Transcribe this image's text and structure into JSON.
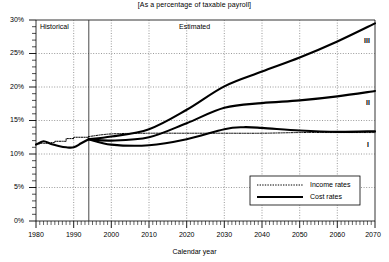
{
  "chart_data": {
    "type": "line",
    "title": "[As a percentage of taxable payroll]",
    "xlabel": "Calendar year",
    "ylabel": "",
    "xlim": [
      1980,
      2070
    ],
    "ylim": [
      0,
      30
    ],
    "grid": true,
    "x_ticks": [
      1980,
      1990,
      2000,
      2010,
      2020,
      2030,
      2040,
      2050,
      2060,
      2070
    ],
    "x_tick_labels": [
      "1980",
      "1990",
      "2000",
      "2010",
      "2020",
      "2030",
      "2040",
      "2050",
      "2060",
      "2070"
    ],
    "y_ticks": [
      0,
      5,
      10,
      15,
      20,
      25,
      30
    ],
    "y_tick_labels": [
      "0%",
      "5%",
      "10%",
      "15%",
      "20%",
      "25%",
      "30%"
    ],
    "y_minor_tick_step": 1,
    "legend_position": "lower-right",
    "legend": [
      {
        "name": "Income rates",
        "style": "dotted-thin"
      },
      {
        "name": "Cost rates",
        "style": "solid-thick"
      }
    ],
    "annotations": [
      {
        "text": "Historical",
        "x": 1983.5,
        "y": 28.1
      },
      {
        "text": "Estimated",
        "x": 2019.0,
        "y": 28.1
      },
      {
        "text": "III",
        "x": 2067.0,
        "y": 25.9
      },
      {
        "text": "II",
        "x": 2067.0,
        "y": 17.5
      },
      {
        "text": "I",
        "x": 2067.0,
        "y": 11.6
      }
    ],
    "divider_year": 1994,
    "series": [
      {
        "name": "Income rates (historical)",
        "style": "dotted-thin",
        "x": [
          1980,
          1981,
          1982,
          1983,
          1984,
          1985,
          1986,
          1987,
          1988,
          1989,
          1990,
          1991,
          1992,
          1993,
          1994
        ],
        "values": [
          11.5,
          11.6,
          11.6,
          11.6,
          11.7,
          11.9,
          11.9,
          11.9,
          12.3,
          12.3,
          12.5,
          12.5,
          12.5,
          12.5,
          12.6
        ]
      },
      {
        "name": "Income rates (estimated)",
        "style": "dotted-thin",
        "x": [
          1994,
          2000,
          2010,
          2020,
          2030,
          2040,
          2050,
          2060,
          2070
        ],
        "values": [
          12.6,
          13.0,
          13.1,
          13.1,
          13.1,
          13.1,
          13.2,
          13.2,
          13.2
        ]
      },
      {
        "name": "Cost rates (historical)",
        "style": "solid-thick",
        "x": [
          1980,
          1982,
          1984,
          1986,
          1988,
          1990,
          1992,
          1994
        ],
        "values": [
          11.4,
          11.9,
          11.5,
          11.2,
          11.0,
          11.0,
          11.6,
          12.2
        ]
      },
      {
        "name": "Cost rates alternative I (low cost)",
        "style": "solid-thick",
        "x": [
          1994,
          2000,
          2010,
          2020,
          2030,
          2035,
          2040,
          2050,
          2060,
          2070
        ],
        "values": [
          12.2,
          11.4,
          11.3,
          12.2,
          13.7,
          14.0,
          13.9,
          13.5,
          13.3,
          13.4
        ]
      },
      {
        "name": "Cost rates alternative II (intermediate)",
        "style": "solid-thick",
        "x": [
          1994,
          2000,
          2010,
          2020,
          2030,
          2040,
          2050,
          2060,
          2070
        ],
        "values": [
          12.2,
          12.0,
          12.5,
          14.6,
          16.9,
          17.6,
          18.0,
          18.6,
          19.4
        ]
      },
      {
        "name": "Cost rates alternative III (high cost)",
        "style": "solid-thick",
        "x": [
          1994,
          2000,
          2010,
          2020,
          2030,
          2040,
          2050,
          2060,
          2070
        ],
        "values": [
          12.2,
          12.6,
          13.7,
          16.6,
          20.1,
          22.3,
          24.4,
          26.8,
          29.5
        ]
      }
    ]
  },
  "labels": {
    "historical": "Historical",
    "estimated": "Estimated",
    "curve_i": "I",
    "curve_ii": "II",
    "curve_iii": "III",
    "legend_income": "Income rates",
    "legend_cost": "Cost rates",
    "axis_x_title": "Calendar year",
    "title": "[As a percentage of taxable payroll]",
    "y0": "0%",
    "y5": "5%",
    "y10": "10%",
    "y15": "15%",
    "y20": "20%",
    "y25": "25%",
    "y30": "30%",
    "x1980": "1980",
    "x1990": "1990",
    "x2000": "2000",
    "x2010": "2010",
    "x2020": "2020",
    "x2030": "2030",
    "x2040": "2040",
    "x2050": "2050",
    "x2060": "2060",
    "x2070": "2070"
  }
}
